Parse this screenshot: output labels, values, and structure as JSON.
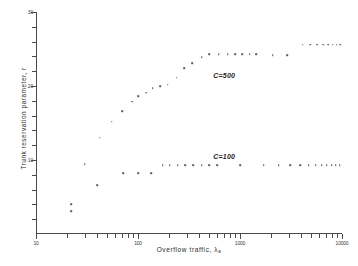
{
  "chart_data": {
    "type": "scatter",
    "title": "",
    "xlabel": "Overflow traffic, λ",
    "xlabel_sub": "a",
    "ylabel": "Trunk reservation parameter, r",
    "xscale": "log",
    "yscale": "linear",
    "xlim": [
      10,
      10000
    ],
    "ylim": [
      0,
      30
    ],
    "grid": false,
    "legend_position": "inline-annotation",
    "x_ticks_major": [
      10,
      100,
      1000,
      10000
    ],
    "x_tick_labels": [
      "10",
      "100",
      "1000",
      "10000"
    ],
    "x_ticks_minor": [
      20,
      30,
      40,
      50,
      60,
      70,
      80,
      90,
      200,
      300,
      400,
      500,
      600,
      700,
      800,
      900,
      2000,
      3000,
      4000,
      5000,
      6000,
      7000,
      8000,
      9000
    ],
    "y_ticks_major": [
      10,
      20,
      30
    ],
    "y_tick_labels": [
      "10",
      "20",
      "30"
    ],
    "y_ticks_minor": [
      2,
      4,
      6,
      8,
      12,
      14,
      16,
      18,
      22,
      24,
      26,
      28
    ],
    "series": [
      {
        "name": "C=500",
        "label": "C=500",
        "label_x": 700,
        "label_y": 21.5,
        "points": [
          {
            "x": 22,
            "y": 4.0
          },
          {
            "x": 30,
            "y": 9.4
          },
          {
            "x": 42,
            "y": 13.0
          },
          {
            "x": 55,
            "y": 15.2
          },
          {
            "x": 70,
            "y": 16.6
          },
          {
            "x": 88,
            "y": 17.9
          },
          {
            "x": 100,
            "y": 18.6
          },
          {
            "x": 120,
            "y": 19.1
          },
          {
            "x": 140,
            "y": 19.7
          },
          {
            "x": 165,
            "y": 20.0
          },
          {
            "x": 195,
            "y": 20.2
          },
          {
            "x": 240,
            "y": 21.1
          },
          {
            "x": 285,
            "y": 22.4
          },
          {
            "x": 340,
            "y": 23.1
          },
          {
            "x": 420,
            "y": 23.9
          },
          {
            "x": 500,
            "y": 24.3
          },
          {
            "x": 620,
            "y": 24.3
          },
          {
            "x": 760,
            "y": 24.3
          },
          {
            "x": 900,
            "y": 24.3
          },
          {
            "x": 1050,
            "y": 24.3
          },
          {
            "x": 1250,
            "y": 24.3
          },
          {
            "x": 1450,
            "y": 24.3
          },
          {
            "x": 2100,
            "y": 24.2
          },
          {
            "x": 2900,
            "y": 24.2
          },
          {
            "x": 4100,
            "y": 25.6
          },
          {
            "x": 4900,
            "y": 25.6
          },
          {
            "x": 5700,
            "y": 25.6
          },
          {
            "x": 6500,
            "y": 25.6
          },
          {
            "x": 7300,
            "y": 25.6
          },
          {
            "x": 8100,
            "y": 25.6
          },
          {
            "x": 8900,
            "y": 25.6
          },
          {
            "x": 9600,
            "y": 25.6
          }
        ]
      },
      {
        "name": "C=100",
        "label": "C=100",
        "label_x": 700,
        "label_y": 10.6,
        "points": [
          {
            "x": 22,
            "y": 3.1
          },
          {
            "x": 40,
            "y": 6.6
          },
          {
            "x": 72,
            "y": 8.2
          },
          {
            "x": 100,
            "y": 8.2
          },
          {
            "x": 135,
            "y": 8.2
          },
          {
            "x": 175,
            "y": 9.3
          },
          {
            "x": 205,
            "y": 9.3
          },
          {
            "x": 245,
            "y": 9.3
          },
          {
            "x": 290,
            "y": 9.3
          },
          {
            "x": 350,
            "y": 9.3
          },
          {
            "x": 420,
            "y": 9.3
          },
          {
            "x": 500,
            "y": 9.3
          },
          {
            "x": 600,
            "y": 9.3
          },
          {
            "x": 1000,
            "y": 9.3
          },
          {
            "x": 1700,
            "y": 9.3
          },
          {
            "x": 2400,
            "y": 9.3
          },
          {
            "x": 3100,
            "y": 9.3
          },
          {
            "x": 3900,
            "y": 9.3
          },
          {
            "x": 4700,
            "y": 9.3
          },
          {
            "x": 5500,
            "y": 9.3
          },
          {
            "x": 6300,
            "y": 9.3
          },
          {
            "x": 7100,
            "y": 9.3
          },
          {
            "x": 7900,
            "y": 9.3
          },
          {
            "x": 8700,
            "y": 9.3
          },
          {
            "x": 9500,
            "y": 9.3
          }
        ]
      }
    ],
    "colors": {
      "axis": "#4a4a4a",
      "point": "#5b5b5b",
      "text": "#2b2b2b",
      "background": "#ffffff"
    }
  }
}
